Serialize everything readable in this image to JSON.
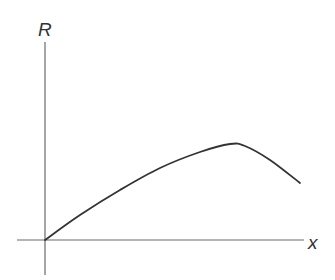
{
  "chart_data": {
    "type": "line",
    "title": "",
    "xlabel": "x",
    "ylabel": "R",
    "grid": false,
    "legend": null,
    "series": [
      {
        "name": "R(x)",
        "points_px": [
          [
            45,
            240
          ],
          [
            80,
            215
          ],
          [
            120,
            190
          ],
          [
            160,
            168
          ],
          [
            200,
            152
          ],
          [
            230,
            144
          ],
          [
            245,
            146
          ],
          [
            270,
            160
          ],
          [
            300,
            183
          ]
        ]
      }
    ]
  },
  "labels": {
    "y_axis": "R",
    "x_axis": "x"
  },
  "colors": {
    "axis": "#6a6a6a",
    "curve": "#333333"
  }
}
